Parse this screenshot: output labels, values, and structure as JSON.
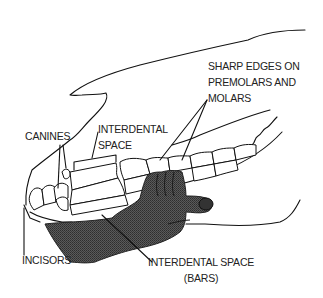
{
  "diagram": {
    "labels": {
      "sharp_edges": [
        "SHARP EDGES ON",
        "PREMOLARS AND",
        "MOLARS"
      ],
      "canines": "CANINES",
      "interdental_space": [
        "INTERDENTAL",
        "SPACE"
      ],
      "incisors": "INCISORS",
      "interdental_space_bars": [
        "INTERDENTAL SPACE",
        "(BARS)"
      ]
    },
    "colors": {
      "line": "#111111",
      "hand_fill": "#4a4a4a",
      "background": "#ffffff"
    }
  }
}
